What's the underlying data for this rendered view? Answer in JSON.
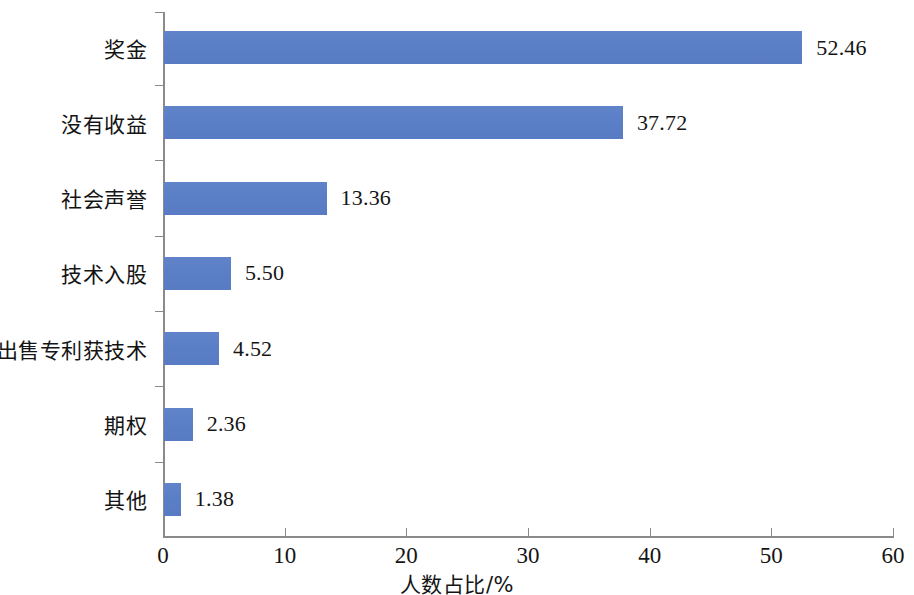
{
  "chart_data": {
    "type": "bar",
    "orientation": "horizontal",
    "title": "",
    "subtitle": "",
    "xlabel": "人数占比/%",
    "ylabel": "",
    "xlim": [
      0,
      60
    ],
    "xticks": [
      0,
      10,
      20,
      30,
      40,
      50,
      60
    ],
    "xtick_labels": [
      "0",
      "10",
      "20",
      "30",
      "40",
      "50",
      "60"
    ],
    "grid": false,
    "legend": null,
    "bar_color": "#5b7fc7",
    "axis_color": "#8a8a8a",
    "categories": [
      "奖金",
      "没有收益",
      "社会声誉",
      "技术入股",
      "出售专利获技术",
      "期权",
      "其他"
    ],
    "values": [
      52.46,
      37.72,
      13.36,
      5.5,
      4.52,
      2.36,
      1.38
    ],
    "value_labels": [
      "52.46",
      "37.72",
      "13.36",
      "5.50",
      "4.52",
      "2.36",
      "1.38"
    ]
  }
}
